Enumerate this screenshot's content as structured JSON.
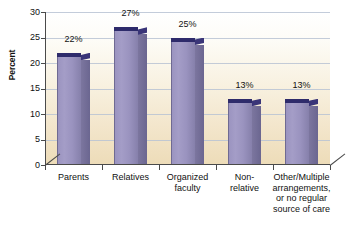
{
  "chart_data": {
    "type": "bar",
    "title": "",
    "subtitle": "",
    "xlabel": "",
    "ylabel": "Percent",
    "ylim": [
      0,
      30
    ],
    "ytick_values": [
      0,
      5,
      10,
      15,
      20,
      25,
      30
    ],
    "ytick_labels": [
      "0",
      "5",
      "10",
      "15",
      "20",
      "25",
      "30"
    ],
    "grid": true,
    "legend": false,
    "categories": [
      "Parents",
      "Relatives",
      "Organized\nfaculty",
      "Non-\nrelative",
      "Other/Multiple\narrangements,\nor no regular\nsource of care"
    ],
    "values": [
      22,
      27,
      25,
      13,
      13
    ],
    "data_labels": [
      "22%",
      "27%",
      "25%",
      "13%",
      "13%"
    ],
    "colors": {
      "bar_front": "#9b94c0",
      "bar_side": "#6b6690",
      "bar_top": "#2e2b6b",
      "gridline": "#b9c3d4",
      "axis": "#4a4a4a",
      "plot_bg_top": "#ffffff",
      "plot_bg_bottom": "#eddcb8",
      "page_bg": "#ffffff",
      "text": "#111111"
    }
  },
  "axis": {
    "y_title": "Percent"
  }
}
